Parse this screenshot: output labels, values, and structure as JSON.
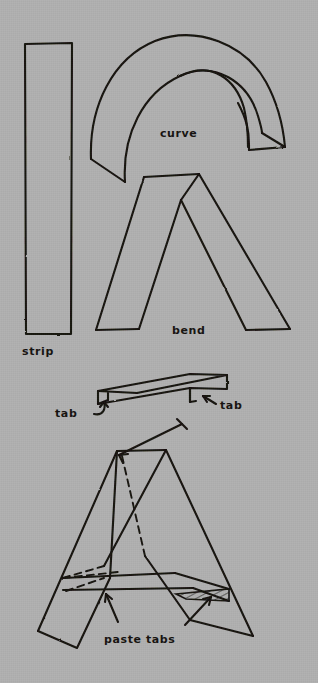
{
  "document": {
    "title": "Paper letter A construction diagram",
    "medium": "hand-drawn pencil sketch on grey paper",
    "background_color": "#b0b0b0",
    "ink_color": "#15120f"
  },
  "labels": {
    "strip": "strip",
    "curve": "curve",
    "bend": "bend",
    "tab_left": "tab",
    "tab_right": "tab",
    "paste_tabs": "paste tabs"
  },
  "figures": [
    {
      "id": "strip",
      "name": "strip",
      "label": "strip",
      "description": "tall narrow flat rectangle of paper",
      "shape": "rectangle"
    },
    {
      "id": "curve",
      "name": "curve",
      "label": "curve",
      "description": "arched band of paper bent into a semicircular arc with angled cut ends",
      "shape": "arch-band"
    },
    {
      "id": "bend",
      "name": "bend",
      "label": "bend",
      "description": "strip folded into an inverted V lambda shape with flat apex",
      "shape": "lambda"
    },
    {
      "id": "tab-strip",
      "name": "tab-strip",
      "label": "tab",
      "description": "flat strip drawn in perspective with a folded tab at each end",
      "shape": "perspective-strip",
      "tab_count": 2
    },
    {
      "id": "assembled-a",
      "name": "assembled-a",
      "label": "paste tabs",
      "description": "finished three dimensional letter A assembled from the folded strips, with hidden edges dashed and a hatched glued sliver",
      "shape": "letter-a-3d"
    }
  ]
}
